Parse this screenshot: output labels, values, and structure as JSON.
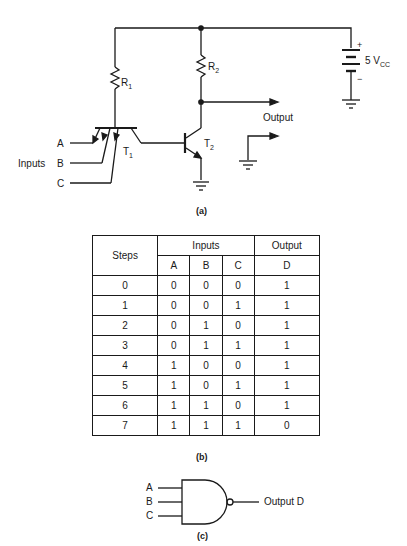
{
  "circuit": {
    "labels": {
      "r1": "R",
      "r1_sub": "1",
      "r2": "R",
      "r2_sub": "2",
      "t1": "T",
      "t1_sub": "1",
      "t2": "T",
      "t2_sub": "2",
      "vcc": "5 V",
      "vcc_sub": "CC",
      "plus": "+",
      "minus": "−",
      "output": "Output",
      "inputs": "Inputs",
      "in_a": "A",
      "in_b": "B",
      "in_c": "C"
    },
    "caption": "(a)"
  },
  "truth_table": {
    "header": {
      "steps": "Steps",
      "inputs": "Inputs",
      "output": "Output",
      "cols": [
        "A",
        "B",
        "C",
        "D"
      ]
    },
    "rows": [
      [
        "0",
        "0",
        "0",
        "0",
        "1"
      ],
      [
        "1",
        "0",
        "0",
        "1",
        "1"
      ],
      [
        "2",
        "0",
        "1",
        "0",
        "1"
      ],
      [
        "3",
        "0",
        "1",
        "1",
        "1"
      ],
      [
        "4",
        "1",
        "0",
        "0",
        "1"
      ],
      [
        "5",
        "1",
        "0",
        "1",
        "1"
      ],
      [
        "6",
        "1",
        "1",
        "0",
        "1"
      ],
      [
        "7",
        "1",
        "1",
        "1",
        "0"
      ]
    ],
    "caption": "(b)"
  },
  "gate": {
    "inputs": [
      "A",
      "B",
      "C"
    ],
    "output": "Output D",
    "caption": "(c)"
  }
}
